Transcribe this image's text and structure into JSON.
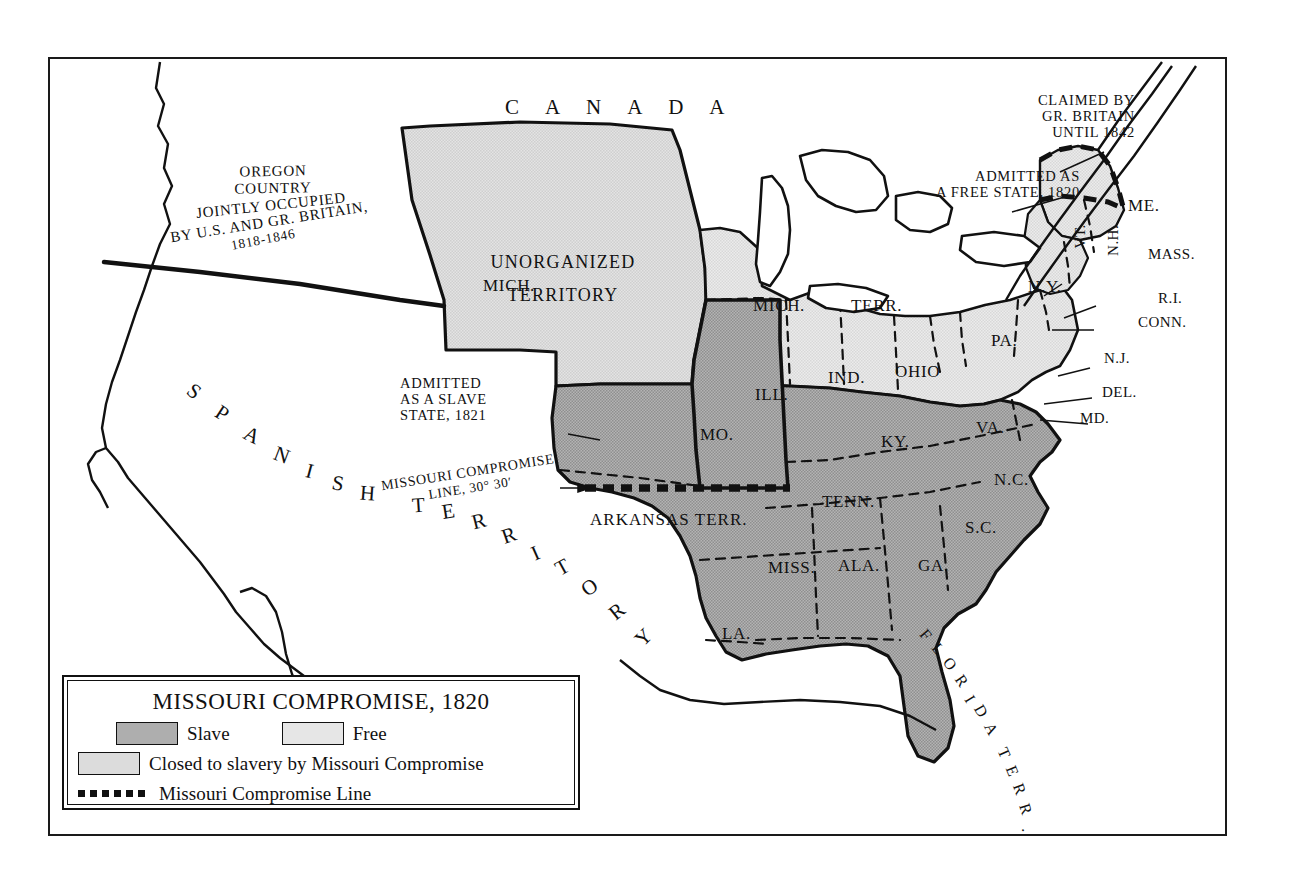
{
  "map": {
    "title": "Missouri Compromise, 1820",
    "regions": {
      "canada": "C A N A D A",
      "oregon_line1": "OREGON",
      "oregon_line2": "COUNTRY",
      "oregon_line3": "JOINTLY OCCUPIED",
      "oregon_line4": "BY U.S. AND GR. BRITAIN,",
      "oregon_line5": "1818-1846",
      "unorganized_line1": "UNORGANIZED",
      "unorganized_line2": "TERRITORY",
      "spanish": "SPANISH TERRITORY",
      "arkansas": "ARKANSAS TERR.",
      "florida": "FLORIDA TERR.",
      "michigan_terr_a": "MICH.",
      "michigan_terr_b": "TERR."
    },
    "annotations": {
      "claimed_line1": "CLAIMED BY",
      "claimed_line2": "GR. BRITAIN",
      "claimed_line3": "UNTIL 1842",
      "free_state_line1": "ADMITTED AS",
      "free_state_line2": "A FREE STATE, 1820",
      "slave_state_line1": "ADMITTED",
      "slave_state_line2": "AS A SLAVE",
      "slave_state_line3": "STATE, 1821",
      "compromise_line1": "MISSOURI COMPROMISE",
      "compromise_line2": "LINE, 30° 30′"
    },
    "states": {
      "mo": "MO.",
      "ill": "ILL.",
      "ind": "IND.",
      "ohio": "OHIO",
      "ky": "KY.",
      "tenn": "TENN.",
      "va": "VA.",
      "nc": "N.C.",
      "sc": "S.C.",
      "ga": "GA.",
      "ala": "ALA.",
      "miss": "MISS.",
      "la": "LA.",
      "pa": "PA.",
      "ny": "N.Y.",
      "vt": "VT.",
      "nh": "N.H.",
      "me": "ME.",
      "mass": "MASS.",
      "ri": "R.I.",
      "conn": "CONN.",
      "nj": "N.J.",
      "del": "DEL.",
      "md": "MD."
    }
  },
  "legend": {
    "title": "MISSOURI COMPROMISE, 1820",
    "slave_label": "Slave",
    "free_label": "Free",
    "closed_label": "Closed to slavery by Missouri Compromise",
    "line_label": "Missouri Compromise Line"
  },
  "colors": {
    "slave_fill": "#a8a8a8",
    "free_fill": "#e3e3e3",
    "closed_fill": "#d9d9d9",
    "ink": "#111111",
    "paper": "#ffffff"
  }
}
